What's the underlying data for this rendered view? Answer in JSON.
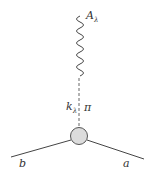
{
  "diagram": {
    "type": "feynman-diagram",
    "labels": {
      "top": "A",
      "top_sub": "λ",
      "momentum": "k",
      "momentum_sub": "λ",
      "exchange": "π",
      "left_leg": "b",
      "right_leg": "a"
    },
    "colors": {
      "line": "#444444",
      "vertex_fill": "#dcdcdc",
      "vertex_stroke": "#555555"
    }
  }
}
